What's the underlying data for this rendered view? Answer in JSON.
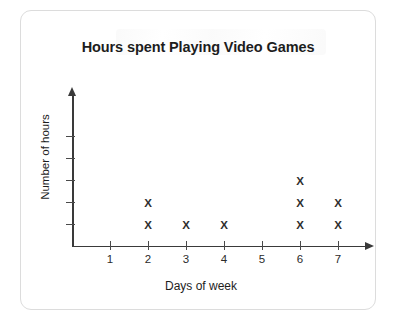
{
  "chart_data": {
    "type": "scatter",
    "plot_style": "dot-plot",
    "title": "Hours spent Playing Video Games",
    "xlabel": "Days of week",
    "ylabel": "Number of hours",
    "categories": [
      "1",
      "2",
      "3",
      "4",
      "5",
      "6",
      "7"
    ],
    "x": [
      1,
      2,
      3,
      4,
      5,
      6,
      7
    ],
    "values": [
      0,
      2,
      1,
      1,
      0,
      3,
      2
    ],
    "marker": "X",
    "x_tick_labels": [
      "1",
      "2",
      "3",
      "4",
      "5",
      "6",
      "7"
    ],
    "y_tick_labels": [
      "",
      "",
      "",
      "",
      ""
    ],
    "y_tick_count": 5,
    "xlim": [
      0,
      7.6
    ],
    "ylim": [
      0,
      5
    ],
    "grid": false,
    "legend": false,
    "axis_arrows": true,
    "colors": {
      "axis": "#3a3a3a",
      "marker": "#2e2e2e",
      "title": "#1d1d1d",
      "card_border": "#dcdcdc",
      "background": "#ffffff"
    },
    "columns": [
      {
        "day": "1",
        "count": 0
      },
      {
        "day": "2",
        "count": 2
      },
      {
        "day": "3",
        "count": 1
      },
      {
        "day": "4",
        "count": 1
      },
      {
        "day": "5",
        "count": 0
      },
      {
        "day": "6",
        "count": 3
      },
      {
        "day": "7",
        "count": 2
      }
    ]
  }
}
